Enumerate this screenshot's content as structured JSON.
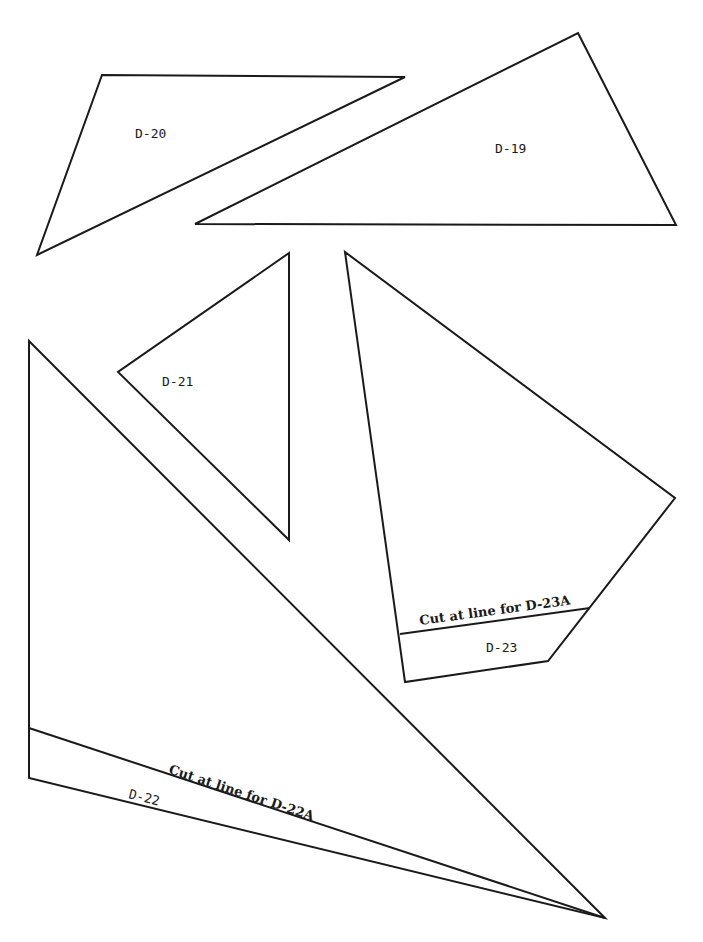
{
  "pieces": [
    {
      "id": "D-20",
      "label": "D-20",
      "points": "102,75 405,77 37,255",
      "label_pos": [
        135,
        138
      ],
      "label_rotate": 0
    },
    {
      "id": "D-19",
      "label": "D-19",
      "points": "578,33 676,225 195,224",
      "label_pos": [
        495,
        153
      ],
      "label_rotate": 0
    },
    {
      "id": "D-21",
      "label": "D-21",
      "points": "289,253 118,372 289,540",
      "label_pos": [
        162,
        386
      ],
      "label_rotate": 0
    },
    {
      "id": "D-23",
      "label": "D-23",
      "points": "345,252 675,498 548,661 405,682",
      "label_pos": [
        486,
        652
      ],
      "label_rotate": 0,
      "cut_line": {
        "x1": 400,
        "y1": 634,
        "x2": 590,
        "y2": 608
      },
      "cut_label": "Cut at line for D-23A",
      "cut_label_pos": [
        420,
        625
      ],
      "cut_label_rotate": -7.8
    },
    {
      "id": "D-22",
      "label": "D-22",
      "points": "29,341 605,918 29,778",
      "label_pos": [
        128,
        798
      ],
      "label_rotate": 14,
      "cut_line": {
        "x1": 29,
        "y1": 728,
        "x2": 605,
        "y2": 918
      },
      "cut_label": "Cut at line for D-22A",
      "cut_label_pos": [
        168,
        776
      ],
      "cut_label_rotate": 18.3
    }
  ]
}
